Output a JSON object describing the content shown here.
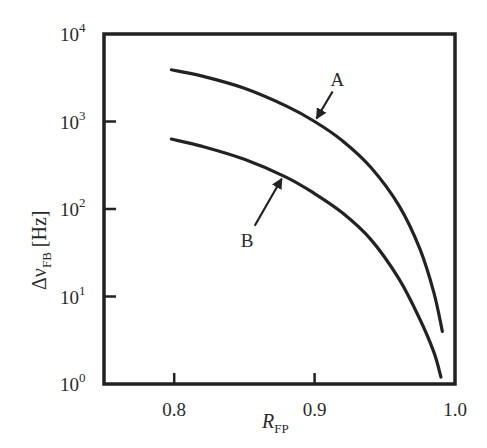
{
  "chart_data": {
    "type": "line",
    "title": "",
    "xlabel": "R_FP",
    "xlabel_main": "R",
    "xlabel_sub": "FP",
    "ylabel": "Δν_FB [Hz]",
    "ylabel_main": "Δν",
    "ylabel_sub": "FB",
    "ylabel_unit": " [Hz]",
    "xscale": "linear",
    "yscale": "log",
    "xlim": [
      0.75,
      1.0
    ],
    "ylim": [
      1,
      10000
    ],
    "grid": false,
    "legend": "none (curves labeled A and B with arrows)",
    "x_ticks": [
      {
        "value": 0.8,
        "label": "0.8"
      },
      {
        "value": 0.9,
        "label": "0.9"
      },
      {
        "value": 1.0,
        "label": "1.0"
      }
    ],
    "y_ticks": [
      {
        "value": 1,
        "base": "10",
        "exp": "0"
      },
      {
        "value": 10,
        "base": "10",
        "exp": "1"
      },
      {
        "value": 100,
        "base": "10",
        "exp": "2"
      },
      {
        "value": 1000,
        "base": "10",
        "exp": "3"
      },
      {
        "value": 10000,
        "base": "10",
        "exp": "4"
      }
    ],
    "series": [
      {
        "name": "A",
        "x": [
          0.798,
          0.82,
          0.85,
          0.88,
          0.9,
          0.92,
          0.94,
          0.96,
          0.975,
          0.985,
          0.991
        ],
        "values": [
          3900,
          3300,
          2400,
          1500,
          1000,
          600,
          300,
          110,
          35,
          11,
          4
        ]
      },
      {
        "name": "B",
        "x": [
          0.798,
          0.82,
          0.85,
          0.88,
          0.9,
          0.92,
          0.94,
          0.96,
          0.975,
          0.985,
          0.99
        ],
        "values": [
          630,
          520,
          370,
          230,
          150,
          90,
          45,
          16,
          5.5,
          2.3,
          1.2
        ]
      }
    ],
    "annotations": [
      {
        "text": "A",
        "target_series": "A",
        "arrow_to_x": 0.9,
        "arrow_to_y": 1000
      },
      {
        "text": "B",
        "target_series": "B",
        "arrow_to_x": 0.878,
        "arrow_to_y": 240
      }
    ]
  },
  "labels": {
    "annot_a": "A",
    "annot_b": "B"
  }
}
